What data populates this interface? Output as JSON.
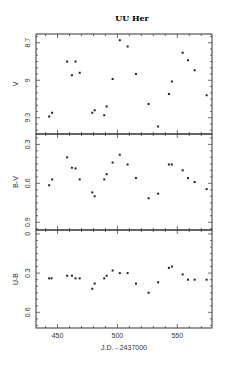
{
  "chart_data": [
    {
      "type": "scatter",
      "title": "UU Her",
      "panel": "top",
      "xlabel": "J.D. - 2437000",
      "ylabel": "V",
      "xlim": [
        432,
        579
      ],
      "ylim": [
        9.43,
        8.63
      ],
      "y_inverted": true,
      "yticks": [
        "8.7",
        "9",
        "9.3"
      ],
      "grid": false,
      "series": [
        {
          "name": "V",
          "x": [
            443,
            445.5,
            458,
            462,
            465,
            468.5,
            479,
            481,
            489,
            491,
            496,
            502,
            508.5,
            515.5,
            526,
            534,
            543,
            545.5,
            554.5,
            559,
            564.5,
            574.5
          ],
          "y": [
            9.29,
            9.26,
            8.85,
            8.96,
            8.85,
            8.94,
            9.26,
            9.24,
            9.28,
            9.21,
            8.99,
            8.68,
            8.73,
            8.95,
            9.19,
            9.37,
            9.11,
            9.01,
            8.78,
            8.84,
            8.92,
            9.12
          ]
        }
      ]
    },
    {
      "type": "scatter",
      "panel": "middle",
      "xlabel": "J.D. - 2437000",
      "ylabel": "B-V",
      "xlim": [
        432,
        579
      ],
      "ylim": [
        0.96,
        0.22
      ],
      "y_inverted": true,
      "yticks": [
        "0.3",
        "0.6",
        "0.9"
      ],
      "grid": false,
      "series": [
        {
          "name": "B-V",
          "x": [
            443,
            445.5,
            458,
            462,
            465,
            468.5,
            479,
            481,
            489,
            491,
            496,
            502,
            508.5,
            515.5,
            526,
            534,
            543,
            545.5,
            554.5,
            559,
            564.5,
            574.5
          ],
          "y": [
            0.615,
            0.57,
            0.4,
            0.48,
            0.485,
            0.57,
            0.67,
            0.7,
            0.57,
            0.53,
            0.44,
            0.38,
            0.455,
            0.56,
            0.715,
            0.68,
            0.455,
            0.455,
            0.5,
            0.56,
            0.59,
            0.645
          ]
        }
      ]
    },
    {
      "type": "scatter",
      "panel": "bottom",
      "xlabel": "J.D. - 2437000",
      "ylabel": "U-B",
      "xlim": [
        432,
        579
      ],
      "ylim": [
        0.72,
        -0.03
      ],
      "y_inverted": true,
      "yticks": [
        "0",
        "0.3",
        "0.6"
      ],
      "xticks": [
        "450",
        "500",
        "550"
      ],
      "grid": false,
      "series": [
        {
          "name": "U-B",
          "x": [
            443,
            445,
            458,
            462,
            465,
            468.5,
            479,
            481,
            489,
            491,
            496,
            502,
            508.5,
            515.5,
            526,
            534,
            543,
            545.5,
            554.5,
            559,
            564.5,
            574.5
          ],
          "y": [
            0.34,
            0.34,
            0.32,
            0.32,
            0.34,
            0.34,
            0.42,
            0.38,
            0.34,
            0.32,
            0.28,
            0.3,
            0.3,
            0.38,
            0.45,
            0.37,
            0.26,
            0.25,
            0.31,
            0.35,
            0.35,
            0.35
          ]
        }
      ]
    }
  ],
  "figure": {
    "title": "UU Her",
    "xlabel": "J.D. - 2437000",
    "panels": [
      {
        "ylabel": "V",
        "yticks": [
          {
            "label": "8.7",
            "v": 8.7
          },
          {
            "label": "9",
            "v": 9.0
          },
          {
            "label": "9.3",
            "v": 9.3
          }
        ]
      },
      {
        "ylabel": "B-V",
        "yticks": [
          {
            "label": "0.3",
            "v": 0.3
          },
          {
            "label": "0.6",
            "v": 0.6
          },
          {
            "label": "0.9",
            "v": 0.9
          }
        ]
      },
      {
        "ylabel": "U-B",
        "yticks": [
          {
            "label": "0",
            "v": 0.0
          },
          {
            "label": "0.3",
            "v": 0.3
          },
          {
            "label": "0.6",
            "v": 0.6
          }
        ]
      }
    ],
    "xticks": [
      {
        "label": "450",
        "v": 450
      },
      {
        "label": "500",
        "v": 500
      },
      {
        "label": "550",
        "v": 550
      }
    ]
  }
}
